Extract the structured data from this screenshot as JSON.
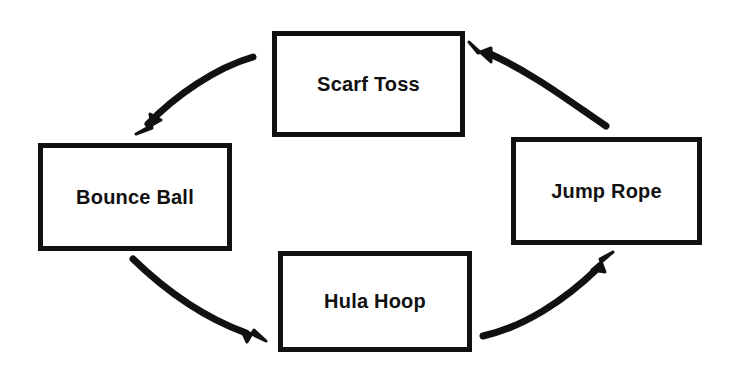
{
  "diagram": {
    "background_color": "#ffffff",
    "stroke_color": "#111111",
    "nodes": [
      {
        "id": "scarf-toss",
        "label": "Scarf Toss"
      },
      {
        "id": "bounce-ball",
        "label": "Bounce Ball"
      },
      {
        "id": "hula-hoop",
        "label": "Hula Hoop"
      },
      {
        "id": "jump-rope",
        "label": "Jump Rope"
      }
    ],
    "edges": [
      {
        "id": "scarf-to-bounce",
        "from": "Scarf Toss",
        "to": "Bounce Ball",
        "style": "curved-arrow"
      },
      {
        "id": "bounce-to-hula",
        "from": "Bounce Ball",
        "to": "Hula Hoop",
        "style": "curved-arrow"
      },
      {
        "id": "hula-to-jump",
        "from": "Hula Hoop",
        "to": "Jump Rope",
        "style": "curved-arrow"
      },
      {
        "id": "jump-to-scarf",
        "from": "Jump Rope",
        "to": "Scarf Toss",
        "style": "curved-arrow"
      }
    ]
  }
}
